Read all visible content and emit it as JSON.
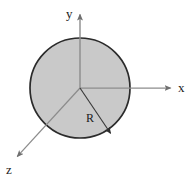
{
  "figure": {
    "background_color": "#ffffff",
    "width": 190,
    "height": 184
  },
  "labels": {
    "y_axis": "y",
    "x_axis": "x",
    "z_axis": "z",
    "radius": "R"
  },
  "colors": {
    "circle_fill": "#c9c9c9",
    "circle_stroke": "#2b2b2b",
    "axis_stroke": "#8c8c8c",
    "radius_stroke": "#3a3a3a",
    "text": "#1a1a1a"
  },
  "chart_data": {
    "type": "diagram",
    "shapes": [
      {
        "name": "sphere-cross-section",
        "kind": "circle",
        "center": [
          80,
          88
        ],
        "radius": 50,
        "fill": "#c9c9c9",
        "stroke": "#2b2b2b",
        "stroke_width": 1.6
      }
    ],
    "axes": [
      {
        "name": "y-axis",
        "label": "y",
        "from": [
          80,
          88
        ],
        "to": [
          80,
          11
        ],
        "arrow": true,
        "direction": "up"
      },
      {
        "name": "x-axis",
        "label": "x",
        "from": [
          80,
          88
        ],
        "to": [
          174,
          88
        ],
        "arrow": true,
        "direction": "right"
      },
      {
        "name": "z-axis",
        "label": "z",
        "from": [
          80,
          88
        ],
        "to": [
          15,
          159
        ],
        "arrow": true,
        "direction": "down-left"
      }
    ],
    "annotations": [
      {
        "name": "radius-arrow",
        "label": "R",
        "from": [
          80,
          88
        ],
        "to": [
          113,
          137
        ],
        "arrow": true,
        "label_position": [
          90,
          120
        ],
        "description": "Arrow from origin to circle edge labeled R"
      }
    ],
    "axis_ranges": null,
    "grid": false,
    "legend": null
  }
}
